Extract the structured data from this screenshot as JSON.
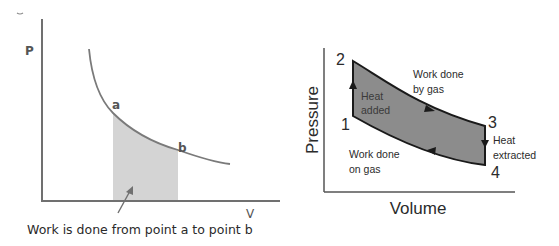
{
  "left_diagram": {
    "y_axis_label": "P",
    "x_axis_label": "V",
    "point_a_label": "a",
    "point_b_label": "b",
    "caption": "Work is done from point a to point b",
    "colors": {
      "axis": "#707070",
      "curve": "#7a7a7a",
      "shaded_area": "#d4d4d4",
      "arrow": "#707070"
    }
  },
  "right_diagram": {
    "y_axis_label": "Pressure",
    "x_axis_label": "Volume",
    "points": [
      {
        "id": "1",
        "label": "1"
      },
      {
        "id": "2",
        "label": "2"
      },
      {
        "id": "3",
        "label": "3"
      },
      {
        "id": "4",
        "label": "4"
      }
    ],
    "annotations": {
      "work_by_gas_line1": "Work done",
      "work_by_gas_line2": "by gas",
      "heat_added_line1": "Heat",
      "heat_added_line2": "added",
      "heat_extracted_line1": "Heat",
      "heat_extracted_line2": "extracted",
      "work_on_gas_line1": "Work done",
      "work_on_gas_line2": "on gas"
    },
    "colors": {
      "axis": "#555555",
      "cycle_fill": "#8c8c8c",
      "cycle_outline": "#1a1a1a"
    }
  }
}
